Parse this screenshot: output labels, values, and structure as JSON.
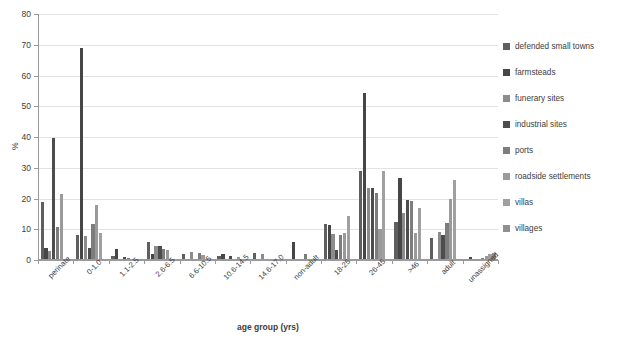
{
  "chart_data": {
    "type": "bar",
    "title": "",
    "xlabel": "age group (yrs)",
    "ylabel": "%",
    "ylim": [
      0,
      80
    ],
    "ytick_step": 10,
    "yticks": [
      0,
      10,
      20,
      30,
      40,
      50,
      60,
      70,
      80
    ],
    "grid": true,
    "legend_position": "right",
    "categories": [
      "perinate",
      "0-1.0",
      "1.1-2.5",
      "2.6-6.5",
      "6.6-10.5",
      "10.6-14.5",
      "14.6-17.0",
      "non-adult",
      "18-25",
      "26-45",
      ">46",
      "adult",
      "unassigned"
    ],
    "series": [
      {
        "name": "defended small towns",
        "color": "#5f5f5f",
        "values": [
          18.8,
          8.2,
          1.2,
          6.0,
          2.1,
          1.4,
          2.2,
          0.0,
          11.7,
          28.8,
          12.3,
          7.3,
          0.0
        ]
      },
      {
        "name": "farmsteads",
        "color": "#464646",
        "values": [
          3.9,
          68.8,
          3.6,
          1.8,
          0.0,
          2.0,
          0.0,
          6.0,
          11.4,
          54.2,
          26.6,
          0.0,
          1.0
        ]
      },
      {
        "name": "funerary sites",
        "color": "#8c8c8c",
        "values": [
          2.9,
          7.9,
          0.0,
          4.7,
          2.5,
          0.4,
          2.0,
          0.2,
          8.6,
          23.3,
          15.4,
          9.2,
          0.0
        ]
      },
      {
        "name": "industrial sites",
        "color": "#4d4d4d",
        "values": [
          39.8,
          4.0,
          0.9,
          4.4,
          0.0,
          1.4,
          0.3,
          0.0,
          3.4,
          23.4,
          19.4,
          8.2,
          0.0
        ]
      },
      {
        "name": "ports",
        "color": "#7d7d7d",
        "values": [
          10.8,
          11.6,
          0.7,
          3.6,
          2.3,
          0.0,
          0.2,
          1.9,
          8.1,
          21.8,
          19.1,
          11.9,
          0.8
        ]
      },
      {
        "name": "roadside settlements",
        "color": "#9a9a9a",
        "values": [
          21.5,
          17.8,
          0.0,
          3.1,
          1.6,
          1.0,
          0.0,
          0.0,
          8.9,
          10.2,
          8.8,
          19.7,
          1.3
        ]
      },
      {
        "name": "villas",
        "color": "#a0a0a0",
        "values": [
          0.0,
          8.7,
          0.0,
          0.0,
          0.0,
          0.0,
          0.0,
          0.0,
          14.2,
          28.9,
          17.0,
          26.1,
          2.0
        ]
      },
      {
        "name": "villages",
        "color": "#8f8f8f",
        "values": [
          0.0,
          0.0,
          0.0,
          0.0,
          0.0,
          0.0,
          0.0,
          0.0,
          0.0,
          0.0,
          0.0,
          0.0,
          2.4
        ]
      }
    ]
  },
  "axis": {
    "x_title": "age group (yrs)",
    "y_title": "%"
  }
}
